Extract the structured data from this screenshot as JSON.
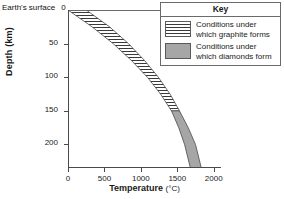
{
  "surface_label": "Earth's surface",
  "surface_value": "0",
  "axis": {
    "y_title": "Depth (km)",
    "x_title": "Temperature",
    "x_unit": "(°C)",
    "y_ticks": [
      "50",
      "100",
      "150",
      "200"
    ],
    "x_ticks": [
      "0",
      "500",
      "1000",
      "1500",
      "2000"
    ]
  },
  "key": {
    "title": "Key",
    "entries": [
      {
        "swatch": "horizontal-hatch-swatch",
        "label": "Conditions under which graphite forms"
      },
      {
        "swatch": "solid-gray-swatch",
        "label": "Conditions under which diamonds form"
      }
    ]
  },
  "colors": {
    "graphite_hatch": "#3a3a3a",
    "diamond_fill": "#a6a6a6",
    "axis": "#4a4a4a",
    "background": "#ffffff"
  },
  "chart_data": {
    "type": "area",
    "title": "",
    "xlabel": "Temperature (°C)",
    "ylabel": "Depth (km)",
    "xlim": [
      0,
      2100
    ],
    "ylim": [
      0,
      235
    ],
    "y_inverted": true,
    "grid": false,
    "legend_position": "top-right",
    "annotations": [
      "Earth's surface at depth 0"
    ],
    "series": [
      {
        "name": "Conditions under which graphite forms",
        "fill": "horizontal-hatch",
        "depth_range_km": [
          0,
          150
        ],
        "boundary_lower_temp_curve": [
          {
            "depth_km": 0,
            "temp_c": 0
          },
          {
            "depth_km": 25,
            "temp_c": 330
          },
          {
            "depth_km": 50,
            "temp_c": 620
          },
          {
            "depth_km": 75,
            "temp_c": 870
          },
          {
            "depth_km": 100,
            "temp_c": 1090
          },
          {
            "depth_km": 125,
            "temp_c": 1270
          },
          {
            "depth_km": 150,
            "temp_c": 1420
          }
        ],
        "boundary_upper_temp_curve": [
          {
            "depth_km": 0,
            "temp_c": 250
          },
          {
            "depth_km": 25,
            "temp_c": 570
          },
          {
            "depth_km": 50,
            "temp_c": 830
          },
          {
            "depth_km": 75,
            "temp_c": 1050
          },
          {
            "depth_km": 100,
            "temp_c": 1240
          },
          {
            "depth_km": 125,
            "temp_c": 1400
          },
          {
            "depth_km": 150,
            "temp_c": 1530
          }
        ]
      },
      {
        "name": "Conditions under which diamonds form",
        "fill": "solid-gray",
        "depth_range_km": [
          150,
          235
        ],
        "boundary_lower_temp_curve": [
          {
            "depth_km": 150,
            "temp_c": 1420
          },
          {
            "depth_km": 175,
            "temp_c": 1520
          },
          {
            "depth_km": 200,
            "temp_c": 1600
          },
          {
            "depth_km": 235,
            "temp_c": 1680
          }
        ],
        "boundary_upper_temp_curve": [
          {
            "depth_km": 150,
            "temp_c": 1530
          },
          {
            "depth_km": 175,
            "temp_c": 1650
          },
          {
            "depth_km": 200,
            "temp_c": 1750
          },
          {
            "depth_km": 235,
            "temp_c": 1830
          }
        ]
      }
    ]
  }
}
